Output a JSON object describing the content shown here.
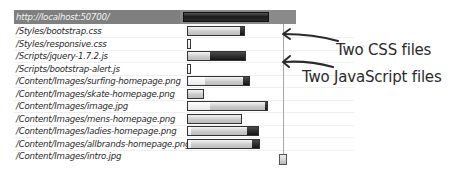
{
  "header": {
    "url": "http://localhost:50700/"
  },
  "requests": [
    {
      "path": "/Styles/bootstrap.css"
    },
    {
      "path": "/Styles/responsive.css"
    },
    {
      "path": "/Scripts/jquery-1.7.2.js"
    },
    {
      "path": "/Scripts/bootstrap-alert.js"
    },
    {
      "path": "/Content/Images/surfing-homepage.png"
    },
    {
      "path": "/Content/Images/skate-homepage.png"
    },
    {
      "path": "/Content/Images/image.jpg"
    },
    {
      "path": "/Content/Images/mens-homepage.png"
    },
    {
      "path": "/Content/Images/ladies-homepage.png"
    },
    {
      "path": "/Content/Images/allbrands-homepage.png"
    },
    {
      "path": "/Content/Images/intro.jpg"
    }
  ],
  "annotations": {
    "css": "Two CSS files",
    "js": "Two JavaScript files"
  },
  "colors": {
    "header_bg": "#7f7f7f",
    "bar_dark": "#1c1c1c",
    "bar_light": "#c9c9c9",
    "timeline_line": "#a6a6a6"
  }
}
